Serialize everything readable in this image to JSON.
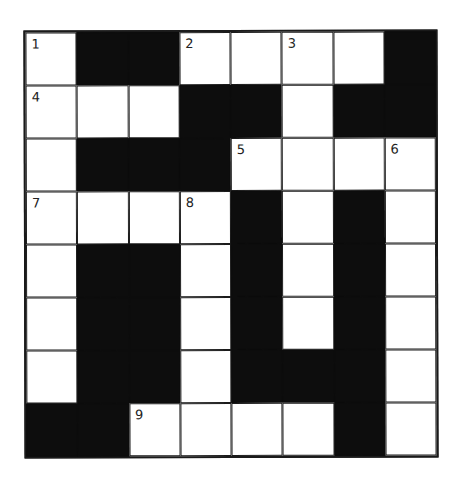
{
  "puzzle": {
    "type": "crossword",
    "rows": 8,
    "cols": 8,
    "colors": {
      "block": "#0d0d0d",
      "cell": "#ffffff",
      "line": "#1a1a1a"
    },
    "grid": [
      [
        "1",
        "#",
        "#",
        "2",
        ".",
        "3",
        ".",
        "#"
      ],
      [
        "4",
        ".",
        ".",
        "#",
        "#",
        ".",
        "#",
        "#"
      ],
      [
        ".",
        "#",
        "#",
        "#",
        "5",
        ".",
        ".",
        "6"
      ],
      [
        "7",
        ".",
        ".",
        "8",
        "#",
        ".",
        "#",
        "."
      ],
      [
        ".",
        "#",
        "#",
        ".",
        "#",
        ".",
        "#",
        "."
      ],
      [
        ".",
        "#",
        "#",
        ".",
        "#",
        ".",
        "#",
        "."
      ],
      [
        ".",
        "#",
        "#",
        ".",
        "#",
        "#",
        "#",
        "."
      ],
      [
        "#",
        "#",
        "9",
        ".",
        ".",
        ".",
        "#",
        "."
      ]
    ],
    "legend": {
      "#": "black square",
      ".": "empty white square",
      "digit": "white square with clue number"
    },
    "clue_numbers": [
      "1",
      "2",
      "3",
      "4",
      "5",
      "6",
      "7",
      "8",
      "9"
    ]
  }
}
